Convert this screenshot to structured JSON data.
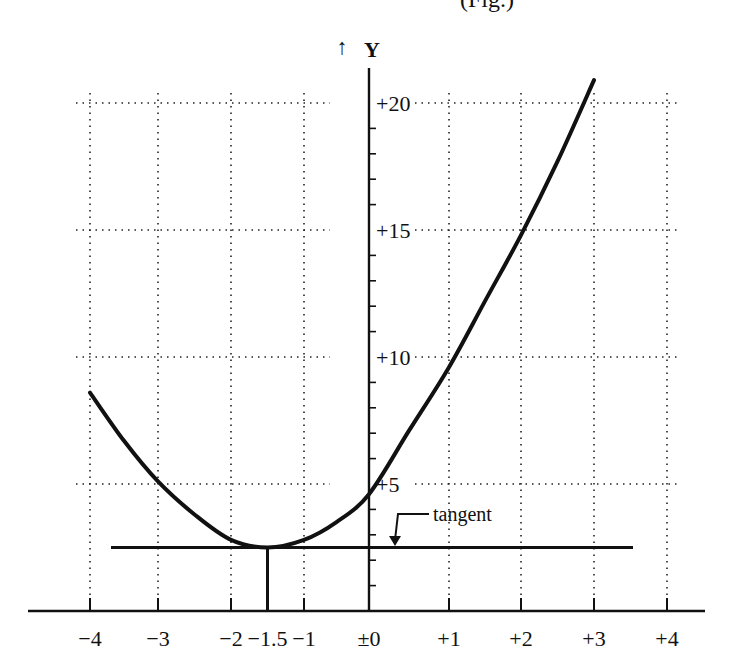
{
  "header": {
    "clipped_caption_fragment": "(Fig.)"
  },
  "chart_data": {
    "type": "line",
    "title": "",
    "xlabel": "",
    "ylabel": "Y",
    "y_axis_arrow": "↑",
    "grid": true,
    "grid_style": "dotted",
    "xlim": [
      -4,
      4
    ],
    "ylim": [
      0,
      20
    ],
    "x_ticks": [
      -4,
      -3,
      -2,
      -1.5,
      -1,
      0,
      1,
      2,
      3,
      4
    ],
    "x_tick_labels": [
      "−4",
      "−3",
      "−2",
      "−1.5",
      "−1",
      "±0",
      "+1",
      "+2",
      "+3",
      "+4"
    ],
    "y_ticks": [
      5,
      10,
      15,
      20
    ],
    "y_tick_labels": [
      "+5",
      "+10",
      "+15",
      "+20"
    ],
    "y_minor_tick_step": 1,
    "series": [
      {
        "name": "curve",
        "x": [
          -4,
          -3.5,
          -3,
          -2.5,
          -2,
          -1.5,
          -1,
          -0.5,
          0,
          0.5,
          1,
          1.5,
          2,
          2.5,
          3
        ],
        "values": [
          8.6,
          6.7,
          5.1,
          3.8,
          2.8,
          2.5,
          2.8,
          3.5,
          4.6,
          7.1,
          9.6,
          12.2,
          14.8,
          17.7,
          20.9
        ]
      }
    ],
    "annotations": [
      {
        "type": "hline",
        "label": "tangent",
        "y": 2.5,
        "x_from": -3.7,
        "x_to": 3.6
      },
      {
        "type": "vline",
        "label": "minimum",
        "x": -1.5,
        "y_from": 0,
        "y_to": 2.5
      }
    ]
  }
}
